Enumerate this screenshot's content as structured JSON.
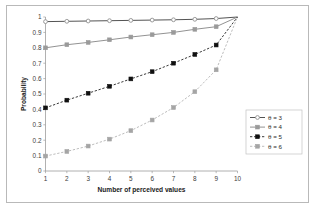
{
  "chart_data": {
    "type": "line",
    "title": "",
    "xlabel": "Number of perceived values",
    "ylabel": "Probability",
    "x": [
      1,
      2,
      3,
      4,
      5,
      6,
      7,
      8,
      9,
      10
    ],
    "xlim": [
      1,
      10
    ],
    "ylim": [
      0,
      1
    ],
    "xticklabels": [
      "1",
      "2",
      "3",
      "4",
      "5",
      "6",
      "7",
      "8",
      "9",
      "10"
    ],
    "yticklabels": [
      "0",
      "0.1",
      "0.2",
      "0.3",
      "0.4",
      "0.5",
      "0.6",
      "0.7",
      "0.8",
      "0.9",
      "1"
    ],
    "ytickvalues": [
      0,
      0.1,
      0.2,
      0.3,
      0.4,
      0.5,
      0.6,
      0.7,
      0.8,
      0.9,
      1
    ],
    "grid": false,
    "legend_position": "right-lower",
    "series": [
      {
        "name": "θ = 3",
        "values": [
          0.97,
          0.972,
          0.974,
          0.976,
          0.978,
          0.98,
          0.982,
          0.985,
          0.99,
          1.0
        ],
        "color": "#4a4a4a",
        "linestyle": "solid",
        "marker": "circle",
        "marker_fill": "#9a9a9a"
      },
      {
        "name": "θ = 4",
        "values": [
          0.8,
          0.82,
          0.835,
          0.852,
          0.87,
          0.885,
          0.9,
          0.92,
          0.937,
          1.0
        ],
        "color": "#8c8c8c",
        "linestyle": "solid",
        "marker": "square",
        "marker_fill": "#9a9a9a"
      },
      {
        "name": "θ = 5",
        "values": [
          0.41,
          0.46,
          0.505,
          0.55,
          0.598,
          0.645,
          0.7,
          0.757,
          0.818,
          1.0
        ],
        "color": "#151515",
        "linestyle": "dashed",
        "marker": "square",
        "marker_fill": "#101010"
      },
      {
        "name": "θ = 6",
        "values": [
          0.097,
          0.127,
          0.162,
          0.207,
          0.262,
          0.331,
          0.412,
          0.515,
          0.657,
          1.0
        ],
        "color": "#b0b0b0",
        "linestyle": "dashed",
        "marker": "square",
        "marker_fill": "#a5a5a5"
      }
    ]
  },
  "colors": {
    "background": "#ffffff",
    "frame_border": "#b9b9b9",
    "axis_line": "#9d9d9d",
    "tick_text": "#3b3b3b",
    "title_text": "#1a1a1a"
  }
}
